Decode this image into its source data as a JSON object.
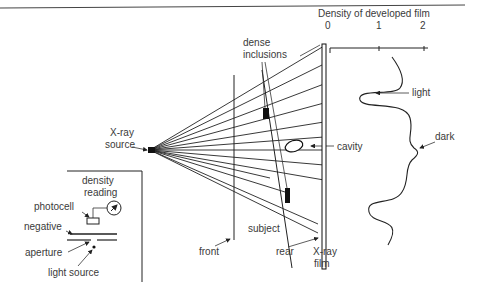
{
  "diagram": {
    "labels": {
      "graph_title": "Density of developed film",
      "tick_0": "0",
      "tick_1": "1",
      "tick_2": "2",
      "dense_1": "dense",
      "dense_2": "inclusions",
      "source_1": "X-ray",
      "source_2": "source",
      "cavity": "cavity",
      "light": "light",
      "dark": "dark",
      "subject": "subject",
      "front": "front",
      "rear": "rear",
      "film_1": "X-ray",
      "film_2": "film"
    },
    "inset": {
      "density_1": "density",
      "density_2": "reading",
      "photocell": "photocell",
      "negative": "negative",
      "aperture": "aperture",
      "light_source": "light source"
    },
    "colors": {
      "line": "#222222",
      "text": "#3a3a3a",
      "background": "#ffffff"
    }
  }
}
